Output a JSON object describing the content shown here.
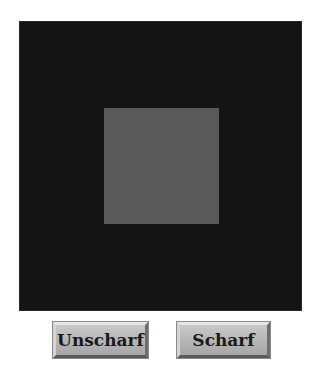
{
  "canvas": {
    "background_color": "#141414",
    "inner_square_color": "#595959"
  },
  "buttons": {
    "unscharf_label": "Unscharf",
    "scharf_label": "Scharf"
  }
}
